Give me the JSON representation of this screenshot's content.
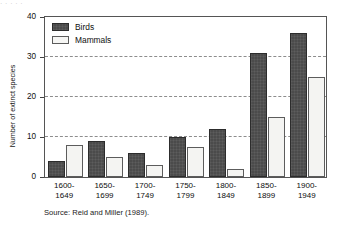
{
  "top_fragment": "·  ·   ·    ·        ·",
  "chart_data": {
    "type": "bar",
    "title": "",
    "xlabel": "",
    "ylabel": "Number of extinct species",
    "ylim": [
      0,
      40
    ],
    "yticks": [
      0,
      10,
      20,
      30,
      40
    ],
    "ytick_labels": [
      "0",
      "10",
      "20",
      "30",
      "40"
    ],
    "grid": "horizontal-dashed",
    "legend_position": "top-left",
    "categories": [
      "1600-\n1649",
      "1650-\n1699",
      "1700-\n1749",
      "1750-\n1799",
      "1800-\n1849",
      "1850-\n1899",
      "1900-\n1949"
    ],
    "category_lines": [
      [
        "1600-",
        "1649"
      ],
      [
        "1650-",
        "1699"
      ],
      [
        "1700-",
        "1749"
      ],
      [
        "1750-",
        "1799"
      ],
      [
        "1800-",
        "1849"
      ],
      [
        "1850-",
        "1899"
      ],
      [
        "1900-",
        "1949"
      ]
    ],
    "series": [
      {
        "name": "Birds",
        "color": "#4b4b4b",
        "values": [
          4,
          9,
          6,
          10,
          12,
          31,
          36
        ]
      },
      {
        "name": "Mammals",
        "color": "#f4f4f2",
        "values": [
          8,
          5,
          3,
          7.5,
          2,
          15,
          25
        ]
      }
    ]
  },
  "legend": [
    {
      "label": "Birds",
      "swatch": "birds"
    },
    {
      "label": "Mammals",
      "swatch": "mammals"
    }
  ],
  "source_note": "Source: Reid and Miller (1989)."
}
